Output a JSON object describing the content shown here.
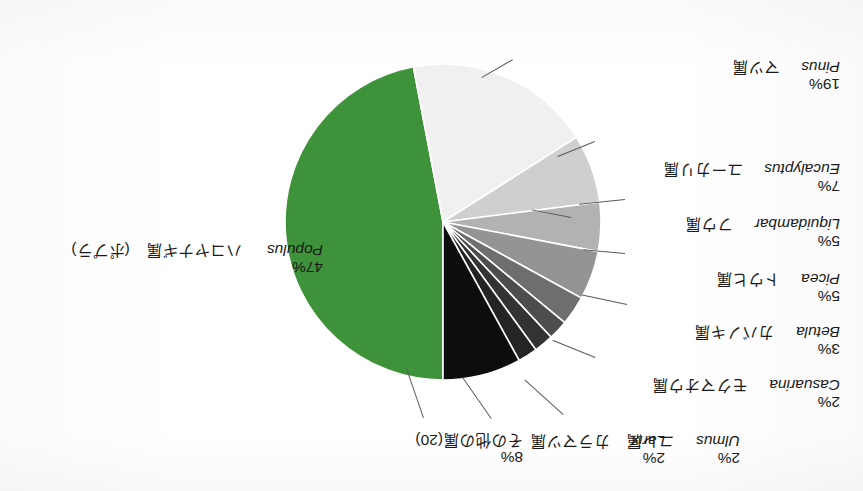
{
  "figure": {
    "kind": "pie-chart",
    "rotation_degrees": 180,
    "background_color": "#ffffff"
  },
  "chart_data": {
    "type": "pie",
    "title": "",
    "subtitle": "",
    "xlabel": "",
    "ylabel": "",
    "legend_position": "callout-labels",
    "grid": false,
    "units": "percent",
    "categories": [
      "ハコヤナギ属 (ポプラ) Populus",
      "マツ属 Pinus",
      "ユーカリ属 Eucalyptus",
      "フウ属 Liquidambar",
      "トウヒ属 Picea",
      "カバノキ属 Betula",
      "モクマオウ属 Casuarina",
      "カラマツ属 Larix",
      "ニレ属 Ulmus",
      "その他の属(20)"
    ],
    "values": [
      47,
      19,
      7,
      5,
      5,
      3,
      2,
      2,
      2,
      8
    ],
    "slices": [
      {
        "id": "populus",
        "name_jp": "ハコヤナギ属",
        "name_jp_alt": "(ポプラ)",
        "name_sci": "Populus",
        "value": 47,
        "label_pct": "47%",
        "color": "#3e9239"
      },
      {
        "id": "pinus",
        "name_jp": "マツ属",
        "name_jp_alt": "",
        "name_sci": "Pinus",
        "value": 19,
        "label_pct": "19%",
        "color": "#f0f0f0"
      },
      {
        "id": "eucalyptus",
        "name_jp": "ユーカリ属",
        "name_jp_alt": "",
        "name_sci": "Eucalyptus",
        "value": 7,
        "label_pct": "7%",
        "color": "#cfcfcf"
      },
      {
        "id": "liquidambar",
        "name_jp": "フウ属",
        "name_jp_alt": "",
        "name_sci": "Liquidambar",
        "value": 5,
        "label_pct": "5%",
        "color": "#b2b2b2"
      },
      {
        "id": "picea",
        "name_jp": "トウヒ属",
        "name_jp_alt": "",
        "name_sci": "Picea",
        "value": 5,
        "label_pct": "5%",
        "color": "#949494"
      },
      {
        "id": "betula",
        "name_jp": "カバノキ属",
        "name_jp_alt": "",
        "name_sci": "Betula",
        "value": 3,
        "label_pct": "3%",
        "color": "#6e6e6e"
      },
      {
        "id": "casuarina",
        "name_jp": "モクマオウ属",
        "name_jp_alt": "",
        "name_sci": "Casuarina",
        "value": 2,
        "label_pct": "2%",
        "color": "#4d4d4d"
      },
      {
        "id": "larix",
        "name_jp": "カラマツ属",
        "name_jp_alt": "",
        "name_sci": "Larix",
        "value": 2,
        "label_pct": "2%",
        "color": "#333333"
      },
      {
        "id": "ulmus",
        "name_jp": "ニレ属",
        "name_jp_alt": "",
        "name_sci": "Ulmus",
        "value": 2,
        "label_pct": "2%",
        "color": "#242424"
      },
      {
        "id": "others",
        "name_jp": "その他の属(20)",
        "name_jp_alt": "",
        "name_sci": "",
        "value": 8,
        "label_pct": "8%",
        "color": "#0d0d0d"
      }
    ]
  }
}
